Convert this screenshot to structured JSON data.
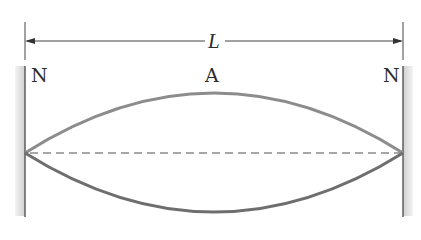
{
  "diagram": {
    "dimension": {
      "label": "L"
    },
    "labels": {
      "left_node": "N",
      "antinode": "A",
      "right_node": "N"
    },
    "colors": {
      "wall": "#555555",
      "wall_shade": "#d6d6d6",
      "string_upper": "#8c8c8c",
      "string_lower": "#6e6e6e",
      "equilibrium": "#8a8a8a",
      "dimension_line": "#444444",
      "text": "#2b2b2b"
    }
  }
}
